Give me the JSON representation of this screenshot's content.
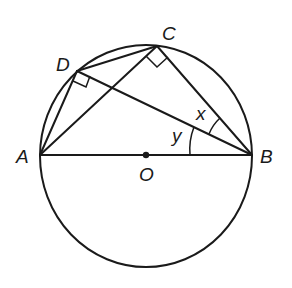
{
  "diagram": {
    "type": "geometry-circle",
    "points": {
      "A": {
        "label": "A",
        "x": 40,
        "y": 155
      },
      "B": {
        "label": "B",
        "x": 252,
        "y": 155
      },
      "O": {
        "label": "O",
        "x": 146,
        "y": 155
      },
      "C": {
        "label": "C",
        "x": 157,
        "y": 46
      },
      "D": {
        "label": "D",
        "x": 77,
        "y": 71
      }
    },
    "angles": {
      "x": {
        "label": "x",
        "at": "B",
        "between": [
          "BC",
          "BD"
        ]
      },
      "y": {
        "label": "y",
        "at": "B",
        "between": [
          "BD",
          "BA"
        ]
      }
    },
    "right_angles": [
      "ACB",
      "ADB"
    ],
    "segments": [
      "AB",
      "AC",
      "AD",
      "DC",
      "CB",
      "DB"
    ],
    "colors": {
      "stroke": "#1a1a1a",
      "background": "#ffffff"
    }
  }
}
